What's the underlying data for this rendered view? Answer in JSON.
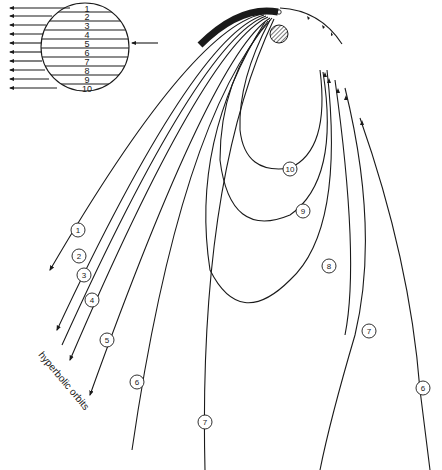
{
  "diagram": {
    "beam": {
      "strip_labels": [
        "1",
        "2",
        "3",
        "4",
        "5",
        "6",
        "7",
        "8",
        "9",
        "10"
      ]
    },
    "orbits": {
      "hyperbolic": [
        {
          "id": "1",
          "label": "1"
        },
        {
          "id": "2",
          "label": "2"
        },
        {
          "id": "3",
          "label": "3"
        },
        {
          "id": "4",
          "label": "4"
        },
        {
          "id": "5",
          "label": "5"
        }
      ],
      "closed": [
        {
          "id": "6",
          "label": "6"
        },
        {
          "id": "7",
          "label": "7"
        },
        {
          "id": "8",
          "label": "8"
        },
        {
          "id": "9",
          "label": "9"
        },
        {
          "id": "10",
          "label": "10"
        }
      ],
      "right_labels": {
        "six": "6",
        "seven": "7"
      }
    },
    "annotation": "hyperbolic orbits",
    "colors": {
      "ink": "#1a1a1a",
      "background": "#ffffff"
    }
  }
}
